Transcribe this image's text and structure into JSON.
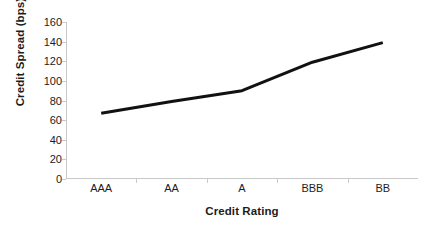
{
  "chart_data": {
    "type": "line",
    "title": "",
    "xlabel": "Credit Rating",
    "ylabel": "Credit Spread (bps)",
    "categories": [
      "AAA",
      "AA",
      "A",
      "BBB",
      "BB"
    ],
    "values": [
      67,
      79,
      90,
      119,
      139
    ],
    "series": [
      {
        "name": "Credit Spread",
        "values": [
          67,
          79,
          90,
          119,
          139
        ]
      }
    ],
    "ylim": [
      0,
      160
    ],
    "yticks": [
      0,
      20,
      40,
      60,
      80,
      100,
      120,
      140,
      160
    ],
    "ytick_labels": [
      "0",
      "20",
      "40",
      "60",
      "80",
      "100",
      "120",
      "140",
      "160"
    ],
    "grid": false,
    "legend": false,
    "legend_position": "none",
    "line_color": "#111111",
    "axis_color": "#c9c9c9",
    "text_color": "#1c1c1c",
    "background_color": "#ffffff"
  }
}
